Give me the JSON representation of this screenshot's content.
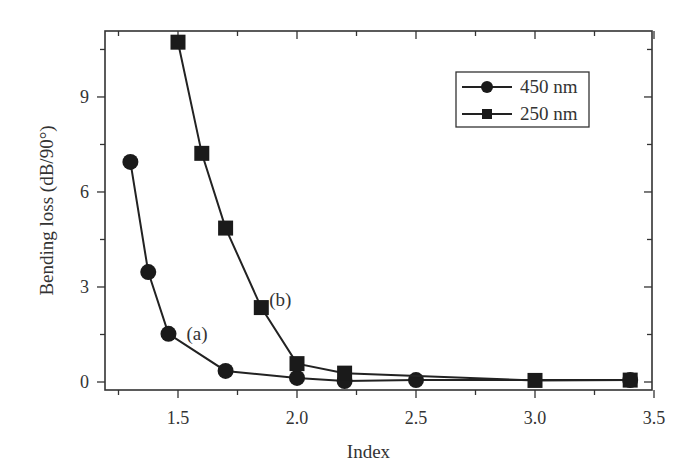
{
  "chart_data": {
    "type": "line",
    "title": "",
    "xlabel": "Index",
    "ylabel": "Bending loss (dB/90°)",
    "xlim": [
      1.2,
      3.5
    ],
    "ylim": [
      -0.25,
      11.1
    ],
    "xticks": [
      1.5,
      2.0,
      2.5,
      3.0,
      3.5
    ],
    "xtick_labels": [
      "1.5",
      "2.0",
      "2.5",
      "3.0",
      "3.5"
    ],
    "yticks": [
      0,
      3,
      6,
      9
    ],
    "ytick_labels": [
      "0",
      "3",
      "6",
      "9"
    ],
    "grid": false,
    "legend_position": "upper right",
    "series": [
      {
        "name": "450 nm",
        "marker": "circle",
        "annotation": "(a)",
        "x": [
          1.3,
          1.375,
          1.46,
          1.7,
          2.0,
          2.2,
          2.5,
          3.4
        ],
        "y": [
          6.95,
          3.47,
          1.52,
          0.35,
          0.13,
          0.03,
          0.06,
          0.06
        ]
      },
      {
        "name": "250 nm",
        "marker": "square",
        "annotation": "(b)",
        "x": [
          1.5,
          1.6,
          1.7,
          1.85,
          2.0,
          2.2,
          3.0,
          3.4
        ],
        "y": [
          10.73,
          7.22,
          4.86,
          2.35,
          0.58,
          0.28,
          0.05,
          0.06
        ]
      }
    ],
    "annotations": [
      {
        "text": "(a)",
        "x": 1.58,
        "y": 1.5
      },
      {
        "text": "(b)",
        "x": 1.93,
        "y": 2.6
      }
    ]
  }
}
